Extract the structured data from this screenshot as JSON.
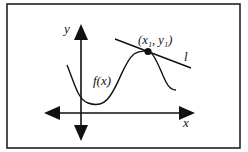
{
  "diagram": {
    "labels": {
      "y_axis": "y",
      "x_axis": "x",
      "function": "f(x)",
      "point": "(x₁, y₁)",
      "tangent_line": "l"
    },
    "colors": {
      "stroke": "#111111",
      "background": "#ffffff",
      "frame": "#222222"
    }
  }
}
